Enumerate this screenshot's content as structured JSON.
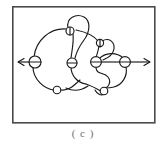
{
  "figure": {
    "caption": "( c )",
    "panel_label": "c",
    "frame": {
      "x": 12,
      "y": 6,
      "width": 143,
      "height": 117,
      "border_color": "#4a4a4a",
      "border_width": 1.6,
      "fill_color": "#ffffff"
    },
    "stroke_color": "#1a1a1a",
    "stroke_width": 1.1,
    "background_color": "#ffffff",
    "axis_line": {
      "label": "horizontal-axis-with-arrowheads",
      "y": 62,
      "x_start": 18,
      "x_end": 150,
      "arrow_left": true,
      "arrow_right": true
    },
    "vertices": [
      {
        "id": "v1",
        "cx": 35,
        "cy": 62,
        "r": 6.0
      },
      {
        "id": "v2",
        "cx": 70,
        "cy": 31,
        "r": 4.0
      },
      {
        "id": "v3",
        "cx": 72,
        "cy": 63,
        "r": 5.0
      },
      {
        "id": "v4",
        "cx": 100,
        "cy": 43,
        "r": 3.6
      },
      {
        "id": "v5",
        "cx": 96,
        "cy": 62,
        "r": 5.4
      },
      {
        "id": "v6",
        "cx": 125,
        "cy": 62,
        "r": 5.4
      },
      {
        "id": "v7",
        "cx": 57,
        "cy": 90,
        "r": 3.8
      },
      {
        "id": "v8",
        "cx": 104,
        "cy": 91,
        "r": 3.8
      }
    ],
    "vertex_count": 8,
    "curve_description": "closed knotted curve with loops and crossings"
  }
}
